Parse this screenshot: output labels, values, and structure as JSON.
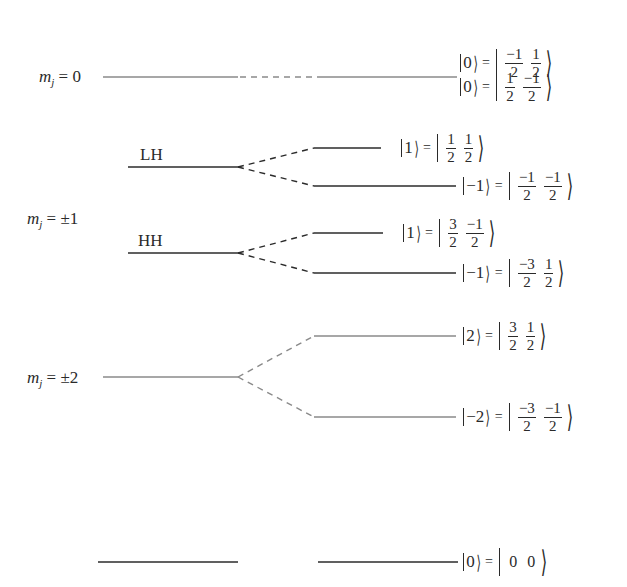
{
  "diagram": {
    "colors": {
      "black_level": "#2b2b2b",
      "gray_level": "#8a8a8a",
      "text": "#2a2a2a"
    },
    "mj_labels": [
      {
        "id": "mj0",
        "symbol": "m",
        "sub": "j",
        "value": "= 0"
      },
      {
        "id": "mj1",
        "symbol": "m",
        "sub": "j",
        "value": "= ±1"
      },
      {
        "id": "mj2",
        "symbol": "m",
        "sub": "j",
        "value": "= ±2"
      }
    ],
    "band_labels": {
      "lh": "LH",
      "hh": "HH"
    },
    "kets": [
      {
        "id": "ket-0-a",
        "state": "0",
        "j": {
          "num": "−1",
          "den": "2"
        },
        "m": {
          "num": "1",
          "den": "2"
        },
        "color": "gray"
      },
      {
        "id": "ket-0-b",
        "state": "0",
        "j": {
          "num": "1",
          "den": "2"
        },
        "m": {
          "num": "−1",
          "den": "2"
        },
        "color": "gray"
      },
      {
        "id": "ket-lh-up",
        "state": "1",
        "j": {
          "num": "1",
          "den": "2"
        },
        "m": {
          "num": "1",
          "den": "2"
        },
        "color": "black"
      },
      {
        "id": "ket-lh-down",
        "state": "−1",
        "j": {
          "num": "−1",
          "den": "2"
        },
        "m": {
          "num": "−1",
          "den": "2"
        },
        "color": "black"
      },
      {
        "id": "ket-hh-up",
        "state": "1",
        "j": {
          "num": "3",
          "den": "2"
        },
        "m": {
          "num": "−1",
          "den": "2"
        },
        "color": "black"
      },
      {
        "id": "ket-hh-down",
        "state": "−1",
        "j": {
          "num": "−3",
          "den": "2"
        },
        "m": {
          "num": "1",
          "den": "2"
        },
        "color": "black"
      },
      {
        "id": "ket-2-up",
        "state": "2",
        "j": {
          "num": "3",
          "den": "2"
        },
        "m": {
          "num": "1",
          "den": "2"
        },
        "color": "gray"
      },
      {
        "id": "ket-2-down",
        "state": "−2",
        "j": {
          "num": "−3",
          "den": "2"
        },
        "m": {
          "num": "−1",
          "den": "2"
        },
        "color": "gray"
      },
      {
        "id": "ket-ground",
        "state": "0",
        "j": {
          "plain": "0"
        },
        "m": {
          "plain": "0"
        },
        "color": "black"
      }
    ]
  }
}
